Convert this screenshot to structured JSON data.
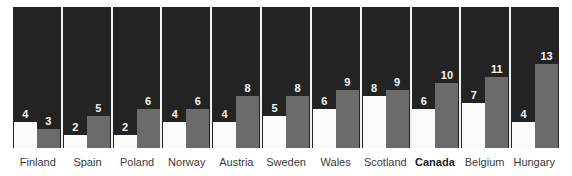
{
  "chart_data": {
    "type": "bar",
    "title": "",
    "subtitle": "",
    "xlabel": "",
    "ylabel": "",
    "grid": false,
    "legend_position": "none",
    "ylim": [
      0,
      14
    ],
    "categories": [
      "Finland",
      "Spain",
      "Poland",
      "Norway",
      "Austria",
      "Sweden",
      "Wales",
      "Scotland",
      "Canada",
      "Belgium",
      "Hungary"
    ],
    "series": [
      {
        "name": "white-bar",
        "color": "#fbfbfb",
        "values": [
          4,
          2,
          2,
          4,
          4,
          5,
          6,
          8,
          6,
          7,
          4
        ]
      },
      {
        "name": "gray-bar",
        "color": "#6b6b6b",
        "values": [
          3,
          5,
          6,
          6,
          8,
          8,
          9,
          9,
          10,
          11,
          13
        ]
      }
    ],
    "highlight_category": "Canada",
    "background_color": "#232323",
    "panel_divider_color": "#f2f2f2",
    "value_label_color": "#f4f4f4",
    "category_label_color": "#3a3a3a"
  }
}
